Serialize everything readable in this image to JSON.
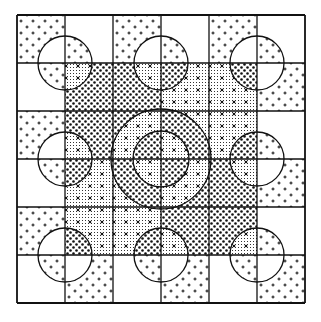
{
  "figure": {
    "grid": {
      "x0": 17,
      "y0": 15,
      "cell": 48,
      "rows": 6,
      "cols": 6
    },
    "colors": {
      "ink": "#111111",
      "paper": "#ffffff"
    },
    "patterns": [
      "white",
      "plus",
      "fine",
      "coarse"
    ],
    "outer_cells_rule": "checkerboard: (row+col) even = plus, odd = white",
    "inner_quadrants": [
      {
        "name": "top-left",
        "x": 65,
        "y": 63,
        "size": 96,
        "base": "coarse",
        "alt": "fine"
      },
      {
        "name": "top-right",
        "x": 161,
        "y": 63,
        "size": 96,
        "base": "fine",
        "alt": "coarse"
      },
      {
        "name": "bottom-left",
        "x": 65,
        "y": 159,
        "size": 96,
        "base": "fine",
        "alt": "coarse"
      },
      {
        "name": "bottom-right",
        "x": 161,
        "y": 159,
        "size": 96,
        "base": "coarse",
        "alt": "fine"
      }
    ],
    "small_circles": [
      {
        "cx": 65,
        "cy": 63,
        "r": 27
      },
      {
        "cx": 161,
        "cy": 63,
        "r": 27
      },
      {
        "cx": 257,
        "cy": 63,
        "r": 27
      },
      {
        "cx": 65,
        "cy": 159,
        "r": 27
      },
      {
        "cx": 257,
        "cy": 159,
        "r": 27
      },
      {
        "cx": 65,
        "cy": 255,
        "r": 27
      },
      {
        "cx": 161,
        "cy": 255,
        "r": 27
      },
      {
        "cx": 257,
        "cy": 255,
        "r": 27
      }
    ],
    "center_circles": [
      {
        "cx": 161,
        "cy": 159,
        "r": 50
      },
      {
        "cx": 161,
        "cy": 159,
        "r": 28
      }
    ]
  }
}
